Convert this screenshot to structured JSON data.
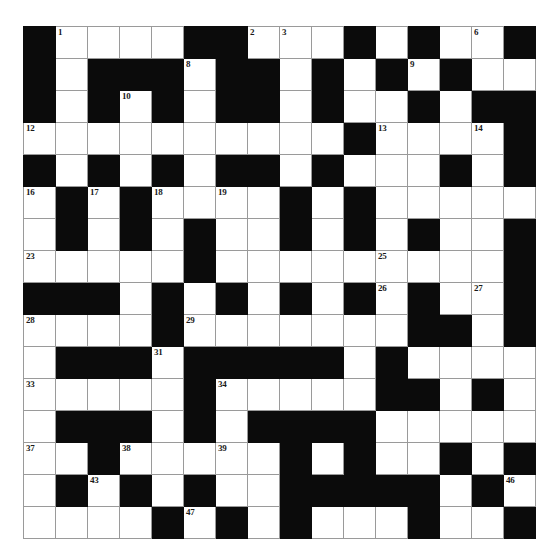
{
  "puzzle": {
    "title": "Crossword Grid",
    "rows": 16,
    "cols": 16,
    "cell_size_px": 31,
    "colors": {
      "block": "#0b0b0b",
      "cell": "#ffffff",
      "gridline": "#9a9a9a",
      "number": "#1a1a1a",
      "page_background": "#ffffff"
    },
    "max_clue_number": 53,
    "grid": [
      "#....##...#.#..#",
      "#.###.##.#.#.#..",
      "#.#.#.##.#..#.##",
      "..........#....#",
      "#.#.#.##.#...#.#",
      ".#.#....#.#.....",
      ".#.#.#..#.#.#..#",
      ".....#.........#",
      "###.#.#.#.#.#..#",
      "....#.......##.#",
      ".###.#####.#....",
      ".....#.....##.#.",
      ".###.#.####.....",
      "..#.....#.#..#.#",
      ".#.#.#..#####.#.",
      "....#.#.#...#..#"
    ],
    "numbers": [
      {
        "n": 1,
        "row": 1,
        "col": 2
      },
      {
        "n": 2,
        "row": 1,
        "col": 8
      },
      {
        "n": 3,
        "row": 1,
        "col": 9
      },
      {
        "n": 4,
        "row": 1,
        "col": 11
      },
      {
        "n": 5,
        "row": 1,
        "col": 13
      },
      {
        "n": 6,
        "row": 1,
        "col": 15
      },
      {
        "n": 7,
        "row": 1,
        "col": 16
      },
      {
        "n": 8,
        "row": 2,
        "col": 6
      },
      {
        "n": 9,
        "row": 2,
        "col": 13
      },
      {
        "n": 10,
        "row": 3,
        "col": 4
      },
      {
        "n": 11,
        "row": 3,
        "col": 10
      },
      {
        "n": 12,
        "row": 4,
        "col": 1
      },
      {
        "n": 13,
        "row": 4,
        "col": 12
      },
      {
        "n": 14,
        "row": 4,
        "col": 15
      },
      {
        "n": 15,
        "row": 5,
        "col": 10
      },
      {
        "n": 16,
        "row": 6,
        "col": 1
      },
      {
        "n": 17,
        "row": 6,
        "col": 3
      },
      {
        "n": 18,
        "row": 6,
        "col": 5
      },
      {
        "n": 19,
        "row": 6,
        "col": 7
      },
      {
        "n": 20,
        "row": 6,
        "col": 11
      },
      {
        "n": 21,
        "row": 7,
        "col": 9
      },
      {
        "n": 22,
        "row": 7,
        "col": 16
      },
      {
        "n": 23,
        "row": 8,
        "col": 1
      },
      {
        "n": 24,
        "row": 8,
        "col": 6
      },
      {
        "n": 25,
        "row": 8,
        "col": 12
      },
      {
        "n": 26,
        "row": 9,
        "col": 12
      },
      {
        "n": 27,
        "row": 9,
        "col": 15
      },
      {
        "n": 28,
        "row": 10,
        "col": 1
      },
      {
        "n": 29,
        "row": 10,
        "col": 6
      },
      {
        "n": 30,
        "row": 10,
        "col": 14
      },
      {
        "n": 31,
        "row": 11,
        "col": 5
      },
      {
        "n": 32,
        "row": 11,
        "col": 12
      },
      {
        "n": 33,
        "row": 12,
        "col": 1
      },
      {
        "n": 34,
        "row": 12,
        "col": 7
      },
      {
        "n": 35,
        "row": 13,
        "col": 6
      },
      {
        "n": 36,
        "row": 13,
        "col": 11
      },
      {
        "n": 37,
        "row": 14,
        "col": 1
      },
      {
        "n": 38,
        "row": 14,
        "col": 4
      },
      {
        "n": 39,
        "row": 14,
        "col": 7
      },
      {
        "n": 40,
        "row": 14,
        "col": 9
      },
      {
        "n": 41,
        "row": 14,
        "col": 11
      },
      {
        "n": 42,
        "row": 14,
        "col": 14
      },
      {
        "n": 43,
        "row": 15,
        "col": 3
      },
      {
        "n": 44,
        "row": 15,
        "col": 11
      },
      {
        "n": 45,
        "row": 15,
        "col": 13
      },
      {
        "n": 46,
        "row": 15,
        "col": 16
      },
      {
        "n": 47,
        "row": 16,
        "col": 6
      },
      {
        "n": 48,
        "row": 17,
        "col": 1
      },
      {
        "n": 49,
        "row": 17,
        "col": 9
      },
      {
        "n": 50,
        "row": 18,
        "col": 9
      },
      {
        "n": 51,
        "row": 18,
        "col": 13
      },
      {
        "n": 52,
        "row": 19,
        "col": 1
      },
      {
        "n": 53,
        "row": 19,
        "col": 14
      }
    ]
  }
}
